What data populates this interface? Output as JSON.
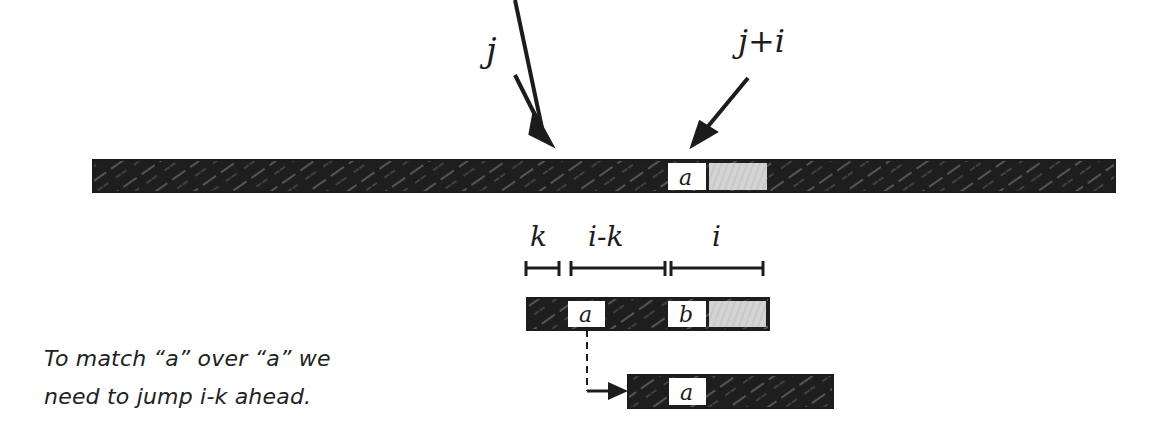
{
  "diagram": {
    "pointers": {
      "j_label": "j",
      "j_plus_i_label": "j+i"
    },
    "text_bar": {
      "cell_a_label": "a"
    },
    "intervals": {
      "k_label": "k",
      "i_minus_k_label": "i-k",
      "i_label": "i"
    },
    "pattern_bar": {
      "cell_a_label": "a",
      "cell_b_label": "b"
    },
    "shifted_bar": {
      "cell_a_label": "a"
    },
    "caption": {
      "line1": "To match “a” over “a” we",
      "line2": "need to jump i-k ahead."
    },
    "colors": {
      "bar_fill": "#1e1e1e",
      "hatch": "#9a9a9a",
      "matched_fill": "#d4d4d4",
      "cell_fill": "#ffffff",
      "ink": "#1c1c1c"
    }
  }
}
